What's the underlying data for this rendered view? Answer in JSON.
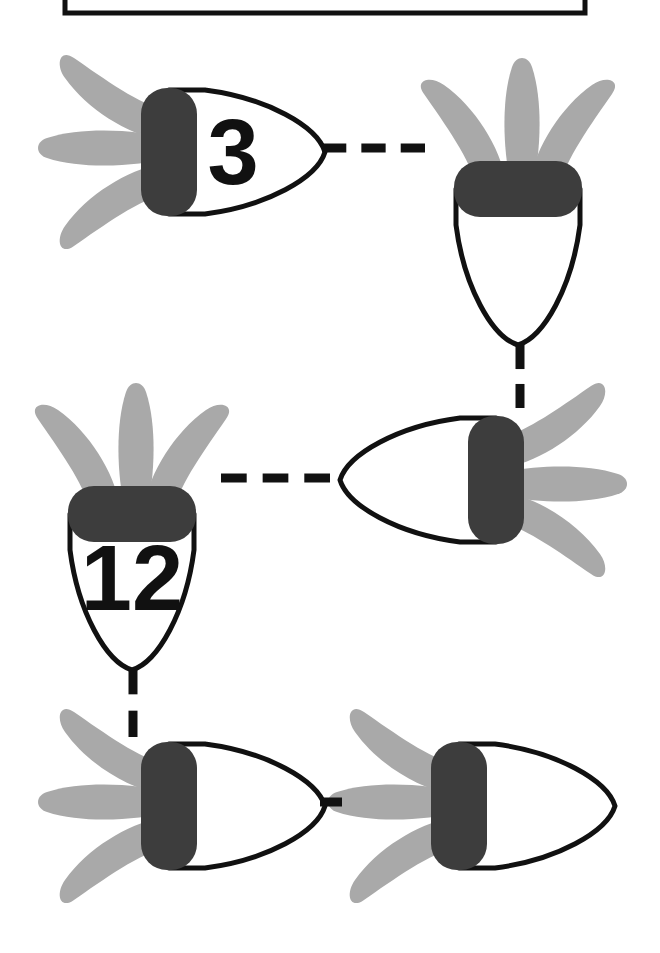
{
  "canvas": {
    "width": 660,
    "height": 953,
    "background": "#ffffff"
  },
  "colors": {
    "outline": "#111111",
    "band": "#3d3d3d",
    "claw": "#a9a9a9",
    "body_fill": "#ffffff",
    "label_text": "#111111",
    "frame_stroke": "#111111",
    "connector": "#111111"
  },
  "frame": {
    "name": "top-frame-box",
    "x": 65,
    "y": -40,
    "width": 520,
    "height": 53,
    "stroke_width": 5
  },
  "shapes": [
    {
      "id": "shape-1",
      "label": "3",
      "has_label": true,
      "orientation": "right",
      "cx": 175,
      "cy": 152,
      "rotation": 0
    },
    {
      "id": "shape-2",
      "label": "",
      "has_label": false,
      "orientation": "down",
      "cx": 518,
      "cy": 195,
      "rotation": 90
    },
    {
      "id": "shape-3",
      "label": "12",
      "has_label": true,
      "orientation": "down",
      "cx": 132,
      "cy": 520,
      "rotation": 90
    },
    {
      "id": "shape-4",
      "label": "",
      "has_label": false,
      "orientation": "left",
      "cx": 490,
      "cy": 480,
      "rotation": 180
    },
    {
      "id": "shape-5",
      "label": "",
      "has_label": false,
      "orientation": "right",
      "cx": 175,
      "cy": 806,
      "rotation": 0
    },
    {
      "id": "shape-6",
      "label": "",
      "has_label": false,
      "orientation": "right",
      "cx": 465,
      "cy": 806,
      "rotation": 0
    }
  ],
  "connectors": [
    {
      "id": "connector-1-2",
      "from": "shape-1",
      "to": "shape-2",
      "direction": "horizontal",
      "x1": 322,
      "y1": 148,
      "x2": 425,
      "y2": 148,
      "dash_count": 3,
      "stroke_width": 9
    },
    {
      "id": "connector-2-4",
      "from": "shape-2",
      "to": "shape-4",
      "direction": "vertical",
      "x1": 520,
      "y1": 345,
      "x2": 520,
      "y2": 408,
      "dash_count": 2,
      "stroke_width": 9
    },
    {
      "id": "connector-3-4",
      "from": "shape-3",
      "to": "shape-4",
      "direction": "horizontal",
      "x1": 221,
      "y1": 478,
      "x2": 330,
      "y2": 478,
      "dash_count": 3,
      "stroke_width": 9
    },
    {
      "id": "connector-3-5",
      "from": "shape-3",
      "to": "shape-5",
      "direction": "vertical",
      "x1": 133,
      "y1": 668,
      "x2": 133,
      "y2": 737,
      "dash_count": 2,
      "stroke_width": 9
    },
    {
      "id": "connector-5-6",
      "from": "shape-5",
      "to": "shape-6",
      "direction": "horizontal",
      "x1": 320,
      "y1": 802,
      "x2": 342,
      "y2": 802,
      "dash_count": 1,
      "stroke_width": 9
    }
  ],
  "labels": {
    "shape_1_value": "3",
    "shape_3_value": "12"
  }
}
